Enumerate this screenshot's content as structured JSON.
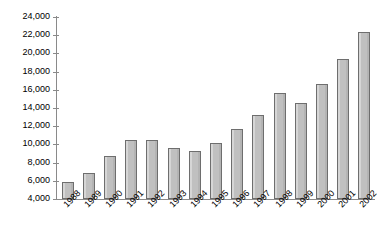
{
  "chart_data": {
    "type": "bar",
    "title": "",
    "subtitle": "",
    "xlabel": "",
    "ylabel": "",
    "grid": false,
    "legend": false,
    "ylim": [
      4000,
      24000
    ],
    "ytick_step": 2000,
    "ytick_labels": [
      "24,000",
      "22,000",
      "20,000",
      "18,000",
      "16,000",
      "14,000",
      "12,000",
      "10,000",
      "8,000",
      "6,000",
      "4,000"
    ],
    "ytick_values": [
      24000,
      22000,
      20000,
      18000,
      16000,
      14000,
      12000,
      10000,
      8000,
      6000,
      4000
    ],
    "categories": [
      "1988",
      "1989",
      "1990",
      "1991",
      "1992",
      "1993",
      "1994",
      "1995",
      "1996",
      "1997",
      "1998",
      "1999",
      "2000",
      "2001",
      "2002"
    ],
    "values": [
      5900,
      6900,
      8700,
      10500,
      10500,
      9600,
      9300,
      10200,
      11700,
      13200,
      15700,
      14600,
      16600,
      19400,
      22300
    ],
    "bar_color": "#c0c0c0",
    "bar_border_color": "#6e6e6e",
    "axis_color": "#8a8a8a",
    "background_color": "#ffffff",
    "text_color": "#000000"
  }
}
